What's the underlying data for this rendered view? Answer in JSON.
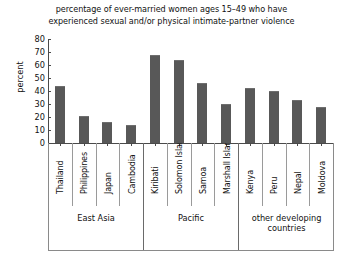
{
  "chart_data": {
    "type": "bar",
    "title": "percentage of ever-married women ages 15–49 who have experienced sexual and/or physical intimate-partner violence",
    "title_lines": [
      "percentage of ever-married women ages 15–49 who have",
      "experienced sexual and/or physical intimate-partner violence"
    ],
    "xlabel": "",
    "ylabel": "percent",
    "ylim": [
      0,
      80
    ],
    "ytick_values": [
      80,
      70,
      60,
      50,
      40,
      30,
      20,
      10,
      0
    ],
    "ytick_labels": [
      "80",
      "70",
      "60",
      "50",
      "40",
      "30",
      "20",
      "10",
      "0"
    ],
    "grid": false,
    "legend": false,
    "bar_color": "#585858",
    "categories": [
      "Thailand",
      "Philippines",
      "Japan",
      "Cambodia",
      "Kiribati",
      "Solomon Islands",
      "Samoa",
      "Marshall Islands",
      "Kenya",
      "Peru",
      "Nepal",
      "Moldova"
    ],
    "values": [
      44,
      21,
      16,
      14,
      68,
      64,
      46,
      30,
      42,
      40,
      33,
      28
    ],
    "groups": [
      {
        "label": "East Asia",
        "label_lines": [
          "East Asia"
        ],
        "count": 4
      },
      {
        "label": "Pacific",
        "label_lines": [
          "Pacific"
        ],
        "count": 4
      },
      {
        "label": "other developing countries",
        "label_lines": [
          "other developing",
          "countries"
        ],
        "count": 4
      }
    ]
  }
}
